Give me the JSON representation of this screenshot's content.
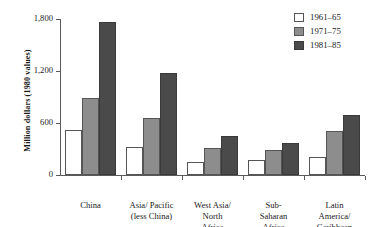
{
  "chart_data": {
    "type": "bar",
    "title": "",
    "xlabel": "",
    "ylabel": "Million dollars (1980 values)",
    "ylim": [
      0,
      1800
    ],
    "yticks": [
      0,
      600,
      1200,
      1800
    ],
    "ytick_labels": [
      "0",
      "600",
      "1,200",
      "1,800"
    ],
    "grid": false,
    "legend_position": "top-right",
    "categories": [
      "China",
      "Asia/ Pacific\n(less China)",
      "West Asia/\nNorth\nAfrica",
      "Sub-\nSaharan\nAfrica",
      "Latin\nAmerica/\nCaribbean"
    ],
    "series": [
      {
        "name": "1961–65",
        "color": "#ffffff",
        "values": [
          520,
          320,
          150,
          175,
          210
        ]
      },
      {
        "name": "1971–75",
        "color": "#8d8d8d",
        "values": [
          885,
          660,
          310,
          290,
          510
        ]
      },
      {
        "name": "1981–85",
        "color": "#4a4a4a",
        "values": [
          1760,
          1180,
          455,
          375,
          690
        ]
      }
    ]
  }
}
